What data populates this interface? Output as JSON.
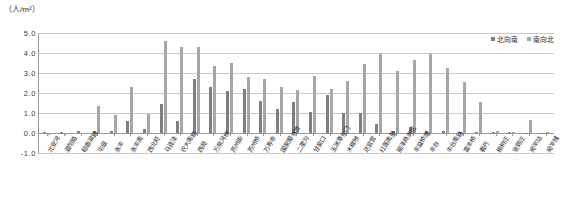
{
  "chart_data": {
    "type": "bar",
    "title": "",
    "unit_caption": "（人/m²）",
    "ylabel": "",
    "xlabel": "",
    "ylim": [
      -1.0,
      5.0
    ],
    "yticks": [
      "-1.0",
      "0.0",
      "1.0",
      "2.0",
      "3.0",
      "4.0",
      "5.0"
    ],
    "grid": true,
    "legend_position": "top-right",
    "colors": {
      "series_north_south": "#7f7f7f",
      "series_south_north": "#a6a6a6",
      "gridline": "#c9c9c9",
      "axis": "#9a9a9a",
      "text": "#1f1f1f"
    },
    "categories": [
      "北安河",
      "温阳路",
      "稻香湖路",
      "屯佃",
      "永丰",
      "永丰南",
      "西北旺",
      "马连洼",
      "农大南路",
      "西苑",
      "万泉河桥",
      "苏州街",
      "苏州桥",
      "万寿寺",
      "国家图书馆",
      "二里沟",
      "甘家口",
      "玉渊潭东门",
      "木樨地",
      "达官营",
      "红莲南里",
      "丽泽商务区",
      "丰益桥南",
      "丰台",
      "丰台南路",
      "富丰桥",
      "看丹",
      "榆树庄",
      "张郭庄",
      "宛平站",
      "宛平城"
    ],
    "series": [
      {
        "name": "北向南",
        "values": [
          0.03,
          0.05,
          0.08,
          0.1,
          0.12,
          0.62,
          0.18,
          1.45,
          0.6,
          2.7,
          2.3,
          2.1,
          2.2,
          1.6,
          1.2,
          1.55,
          1.05,
          1.9,
          1.0,
          1.0,
          0.45,
          0.12,
          0.32,
          0.1,
          0.08,
          0.06,
          0.05,
          0.04,
          0.03,
          0.02,
          0.02
        ]
      },
      {
        "name": "南向北",
        "values": [
          -0.1,
          -0.08,
          0.0,
          1.35,
          0.9,
          2.28,
          0.95,
          4.6,
          4.3,
          4.3,
          3.35,
          3.5,
          2.8,
          2.7,
          2.3,
          2.15,
          2.85,
          2.2,
          2.6,
          3.45,
          3.95,
          3.1,
          3.65,
          3.95,
          3.25,
          2.55,
          1.55,
          0.1,
          0.05,
          0.65,
          0.05
        ]
      }
    ]
  },
  "legend": {
    "items": [
      {
        "label": "北向南",
        "color": "#7f7f7f"
      },
      {
        "label": "南向北",
        "color": "#a6a6a6"
      }
    ]
  }
}
